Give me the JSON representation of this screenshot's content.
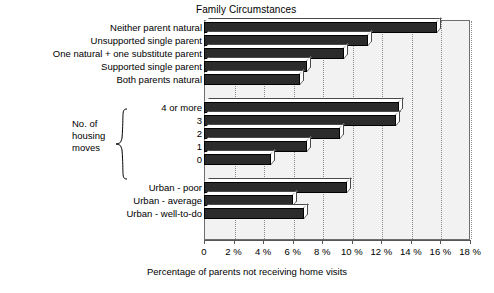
{
  "chart_data": {
    "type": "bar",
    "orientation": "horizontal",
    "title": "Family Circumstances",
    "xlabel": "Percentage of parents not receiving home visits",
    "ylabel": "",
    "xlim": [
      0,
      18
    ],
    "xticks": [
      0,
      2,
      4,
      6,
      8,
      10,
      12,
      14,
      16,
      18
    ],
    "xtick_labels": [
      "0",
      "2 %",
      "4 %",
      "6 %",
      "8 %",
      "10 %",
      "12 %",
      "14 %",
      "16 %",
      "18 %"
    ],
    "grid": "vertical-dotted",
    "legend": "none",
    "bar_style": "3d-shaded-dark",
    "categories": [
      "Neither parent natural",
      "Unsupported single parent",
      "One natural + one substitute parent",
      "Supported single parent",
      "Both parents natural",
      "4 or more",
      "3",
      "2",
      "1",
      "0",
      "Urban - poor",
      "Urban - average",
      "Urban - well-to-do"
    ],
    "values": [
      15.8,
      11.1,
      9.5,
      7.0,
      6.5,
      13.2,
      13.0,
      9.2,
      7.0,
      4.5,
      9.7,
      6.0,
      6.8
    ],
    "groups": [
      {
        "name": "Family Circumstances",
        "annotation": "",
        "categories": [
          "Neither parent natural",
          "Unsupported single parent",
          "One natural + one substitute parent",
          "Supported single parent",
          "Both parents natural"
        ],
        "values": [
          15.8,
          11.1,
          9.5,
          7.0,
          6.5
        ]
      },
      {
        "name": "No. of housing moves",
        "annotation_lines": [
          "No. of",
          "housing",
          "moves"
        ],
        "categories": [
          "4 or more",
          "3",
          "2",
          "1",
          "0"
        ],
        "values": [
          13.2,
          13.0,
          9.2,
          7.0,
          4.5
        ]
      },
      {
        "name": "Urban status",
        "annotation": "",
        "categories": [
          "Urban - poor",
          "Urban - average",
          "Urban - well-to-do"
        ],
        "values": [
          9.7,
          6.0,
          6.8
        ]
      }
    ]
  },
  "colors": {
    "bar_fill": "#2b2b2b",
    "bar_outline": "#000000",
    "plot_background": "#f2f2f2",
    "gridline": "#8c8c8c",
    "axis": "#555555",
    "text": "#000000"
  }
}
